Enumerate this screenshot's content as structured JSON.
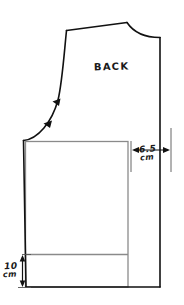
{
  "figure": {
    "background_color": "#ffffff",
    "width": 184,
    "height": 305
  },
  "labels": {
    "piece_name": "BACK",
    "width_value": "6.5",
    "width_unit": "cm",
    "height_value": "10",
    "height_unit": "cm"
  },
  "colors": {
    "outline": "#111111",
    "overlay": "#8a8a8a",
    "annotation": "#1a1a1a"
  },
  "annotations": {
    "armhole_notch_count": 2,
    "armhole_notch_label": "armhole ease arrows",
    "width_dimension_label": "6.5 cm",
    "height_dimension_label": "10 cm"
  },
  "geometry": {
    "shoulder_point": [
      66,
      30
    ],
    "neck_shoulder_point": [
      127,
      22
    ],
    "center_back_top": [
      160,
      38
    ],
    "center_back_bottom": [
      160,
      287
    ],
    "side_seam_top": [
      23,
      140
    ],
    "hem_left": [
      26,
      287
    ],
    "overlay_rect": {
      "left": 25,
      "top": 141,
      "right": 128,
      "bottom": 287
    },
    "hem_line_y": 254
  }
}
